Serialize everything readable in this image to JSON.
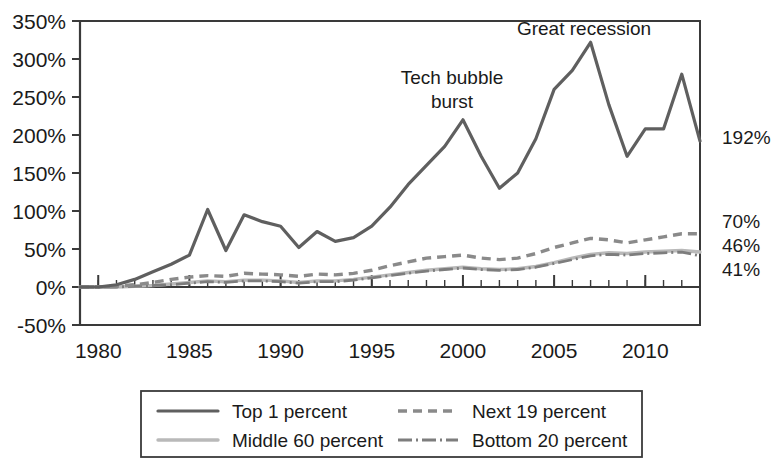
{
  "chart_data": {
    "type": "line",
    "title": "",
    "xlabel": "",
    "ylabel": "",
    "xlim": [
      1979,
      2013
    ],
    "ylim": [
      -50,
      350
    ],
    "y_tick_suffix": "%",
    "grid": false,
    "legend_position": "bottom",
    "x_tick_labels": [
      "1980",
      "1985",
      "1990",
      "1995",
      "2000",
      "2005",
      "2010"
    ],
    "x_ticks": [
      1980,
      1985,
      1990,
      1995,
      2000,
      2005,
      2010
    ],
    "y_tick_labels": [
      "350%",
      "300%",
      "250%",
      "200%",
      "150%",
      "100%",
      "50%",
      "0%",
      "-50%"
    ],
    "y_ticks": [
      350,
      300,
      250,
      200,
      150,
      100,
      50,
      0,
      -50
    ],
    "x": [
      1979,
      1980,
      1981,
      1982,
      1983,
      1984,
      1985,
      1986,
      1987,
      1988,
      1989,
      1990,
      1991,
      1992,
      1993,
      1994,
      1995,
      1996,
      1997,
      1998,
      1999,
      2000,
      2001,
      2002,
      2003,
      2004,
      2005,
      2006,
      2007,
      2008,
      2009,
      2010,
      2011,
      2012,
      2013
    ],
    "series": [
      {
        "name": "Top 1 percent",
        "style": "solid",
        "color": "#5f5f5f",
        "values": [
          0,
          0,
          3,
          10,
          20,
          30,
          42,
          102,
          48,
          95,
          86,
          80,
          52,
          73,
          60,
          65,
          80,
          105,
          135,
          160,
          185,
          220,
          172,
          130,
          150,
          195,
          260,
          285,
          322,
          240,
          172,
          208,
          208,
          280,
          192
        ]
      },
      {
        "name": "Next 19 percent",
        "style": "dashed",
        "color": "#8a8a8a",
        "values": [
          0,
          0,
          1,
          3,
          6,
          10,
          13,
          15,
          14,
          18,
          17,
          16,
          14,
          17,
          16,
          18,
          22,
          28,
          33,
          38,
          40,
          42,
          38,
          36,
          38,
          44,
          52,
          58,
          64,
          62,
          58,
          62,
          66,
          70,
          70
        ]
      },
      {
        "name": "Middle 60 percent",
        "style": "solid-light",
        "color": "#b9b9b9",
        "values": [
          0,
          0,
          0,
          1,
          2,
          4,
          6,
          8,
          7,
          9,
          9,
          8,
          6,
          8,
          8,
          10,
          13,
          16,
          19,
          22,
          24,
          26,
          24,
          23,
          24,
          27,
          32,
          38,
          43,
          45,
          44,
          46,
          47,
          48,
          46
        ]
      },
      {
        "name": "Bottom 20 percent",
        "style": "dash-dot",
        "color": "#7d7d7d",
        "values": [
          0,
          0,
          0,
          1,
          2,
          3,
          5,
          7,
          6,
          8,
          8,
          7,
          5,
          7,
          7,
          9,
          12,
          15,
          18,
          21,
          23,
          25,
          23,
          22,
          23,
          26,
          31,
          36,
          41,
          43,
          42,
          44,
          45,
          46,
          41
        ]
      }
    ],
    "right_end_labels": [
      {
        "text": "192%",
        "value": 192,
        "series": "Top 1 percent"
      },
      {
        "text": "70%",
        "value": 70,
        "series": "Next 19 percent"
      },
      {
        "text": "46%",
        "value": 46,
        "series": "Middle 60 percent"
      },
      {
        "text": "41%",
        "value": 41,
        "series": "Bottom 20 percent"
      }
    ],
    "annotations": [
      {
        "text": "Tech bubble burst",
        "lines": [
          "Tech bubble",
          "burst"
        ],
        "x": 2000,
        "y": 220
      },
      {
        "text": "Great recession",
        "lines": [
          "Great recession"
        ],
        "x": 2007,
        "y": 322
      }
    ]
  },
  "legend": {
    "entries": [
      {
        "label": "Top 1 percent",
        "swatch": "solid-dark-line-icon"
      },
      {
        "label": "Next 19 percent",
        "swatch": "dashed-line-icon"
      },
      {
        "label": "Middle 60 percent",
        "swatch": "solid-light-line-icon"
      },
      {
        "label": "Bottom 20 percent",
        "swatch": "dash-dot-line-icon"
      }
    ]
  }
}
